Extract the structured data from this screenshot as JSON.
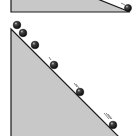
{
  "diagram": {
    "colors": {
      "background": "#ffffff",
      "incline_fill": "#c8c8c8",
      "outline": "#1a1a1a",
      "ball": "#1c1c1c",
      "ball_highlight": "#d0d0d0",
      "motion_lines": "#555555"
    },
    "top_incline": {
      "points": "11,-2 11,12 130,12 95,-2",
      "ball": {
        "cx": 128,
        "cy": 8,
        "r": 3.5
      },
      "motion_marks": [
        {
          "x1": 121,
          "y1": 3,
          "x2": 125,
          "y2": 5
        }
      ]
    },
    "main_incline": {
      "points": "11,29 11,137 119,137",
      "balls": [
        {
          "cx": 17,
          "cy": 25,
          "r": 3.8
        },
        {
          "cx": 23,
          "cy": 33,
          "r": 3.8
        },
        {
          "cx": 35,
          "cy": 45,
          "r": 3.8
        },
        {
          "cx": 54,
          "cy": 65,
          "r": 3.8
        },
        {
          "cx": 80,
          "cy": 92,
          "r": 3.8
        },
        {
          "cx": 113,
          "cy": 125,
          "r": 3.8
        }
      ],
      "motion_marks": [
        {
          "x1": 49,
          "y1": 57,
          "x2": 51,
          "y2": 60
        },
        {
          "x1": 74,
          "y1": 83,
          "x2": 77,
          "y2": 87
        },
        {
          "x1": 76,
          "y1": 84,
          "x2": 79,
          "y2": 88
        },
        {
          "x1": 104,
          "y1": 113,
          "x2": 109,
          "y2": 119
        },
        {
          "x1": 106,
          "y1": 113,
          "x2": 111,
          "y2": 119
        },
        {
          "x1": 108,
          "y1": 114,
          "x2": 112,
          "y2": 119
        }
      ]
    }
  }
}
